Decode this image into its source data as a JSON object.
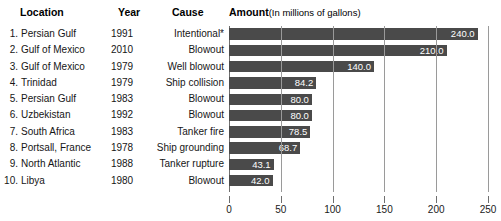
{
  "header": {
    "location": "Location",
    "year": "Year",
    "cause": "Cause",
    "amount": "Amount",
    "amount_sub": "(In millions of gallons)"
  },
  "rows": [
    {
      "rank": "1.",
      "location": "Persian Gulf",
      "year": "1991",
      "cause": "Intentional*",
      "value": 240.0,
      "label": "240.0"
    },
    {
      "rank": "2.",
      "location": "Gulf of Mexico",
      "year": "2010",
      "cause": "Blowout",
      "value": 210.0,
      "label": "210.0"
    },
    {
      "rank": "3.",
      "location": "Gulf of Mexico",
      "year": "1979",
      "cause": "Well blowout",
      "value": 140.0,
      "label": "140.0"
    },
    {
      "rank": "4.",
      "location": "Trinidad",
      "year": "1979",
      "cause": "Ship collision",
      "value": 84.2,
      "label": "84.2"
    },
    {
      "rank": "5.",
      "location": "Persian Gulf",
      "year": "1983",
      "cause": "Blowout",
      "value": 80.0,
      "label": "80.0"
    },
    {
      "rank": "6.",
      "location": "Uzbekistan",
      "year": "1992",
      "cause": "Blowout",
      "value": 80.0,
      "label": "80.0"
    },
    {
      "rank": "7.",
      "location": "South Africa",
      "year": "1983",
      "cause": "Tanker fire",
      "value": 78.5,
      "label": "78.5"
    },
    {
      "rank": "8.",
      "location": "Portsall, France",
      "year": "1978",
      "cause": "Ship grounding",
      "value": 68.7,
      "label": "68.7"
    },
    {
      "rank": "9.",
      "location": "North Atlantic",
      "year": "1988",
      "cause": "Tanker rupture",
      "value": 43.1,
      "label": "43.1"
    },
    {
      "rank": "10.",
      "location": "Libya",
      "year": "1980",
      "cause": "Blowout",
      "value": 42.0,
      "label": "42.0"
    }
  ],
  "chart_data": {
    "type": "bar",
    "orientation": "horizontal",
    "xlabel": "",
    "ylabel": "",
    "xlim": [
      0,
      250
    ],
    "xticks": [
      0,
      50,
      100,
      150,
      200,
      250
    ],
    "xticklabels": [
      "0",
      "50",
      "100",
      "150",
      "200",
      "250"
    ],
    "grid": true,
    "legend": false,
    "bar_color": "#4a4a4a",
    "label_color": "#ffffff",
    "categories": [
      "Persian Gulf",
      "Gulf of Mexico",
      "Gulf of Mexico",
      "Trinidad",
      "Persian Gulf",
      "Uzbekistan",
      "South Africa",
      "Portsall, France",
      "North Atlantic",
      "Libya"
    ],
    "values": [
      240.0,
      210.0,
      140.0,
      84.2,
      80.0,
      80.0,
      78.5,
      68.7,
      43.1,
      42.0
    ],
    "datalabels": [
      "240.0",
      "210.0",
      "140.0",
      "84.2",
      "80.0",
      "80.0",
      "78.5",
      "68.7",
      "43.1",
      "42.0"
    ]
  }
}
